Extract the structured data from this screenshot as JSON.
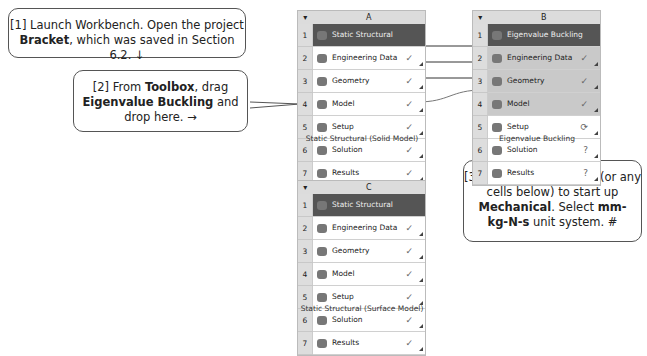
{
  "callouts": [
    {
      "id": 1,
      "parts": [
        [
          "[1] Launch Workbench.  Open the project",
          false
        ],
        [
          "\n",
          false
        ],
        [
          "Bracket",
          true
        ],
        [
          ", which was saved in Section 6.2. ↓",
          false
        ]
      ]
    },
    {
      "id": 2,
      "parts": [
        [
          "[2] From ",
          false
        ],
        [
          "Toolbox",
          true
        ],
        [
          ", drag",
          false
        ],
        [
          "\n",
          false
        ],
        [
          "Eigenvalue Buckling",
          true
        ],
        [
          " and",
          false
        ],
        [
          "\n",
          false
        ],
        [
          "drop here. →",
          false
        ]
      ]
    },
    {
      "id": 3,
      "parts": [
        [
          "[3] Double-click ",
          false
        ],
        [
          "Setup",
          true
        ],
        [
          " (or any",
          false
        ],
        [
          "\n",
          false
        ],
        [
          "cells below) to start up",
          false
        ],
        [
          "\n",
          false
        ],
        [
          "Mechanical",
          true
        ],
        [
          ".  Select ",
          false
        ],
        [
          "mm-",
          true
        ],
        [
          "\n",
          false
        ],
        [
          "kg-N-s",
          true
        ],
        [
          " unit system.  #",
          false
        ]
      ]
    }
  ],
  "systems": [
    {
      "col": "A",
      "caption": "Static Structural (Solid Model)",
      "rows": [
        {
          "n": "1",
          "label": "Static Structural",
          "status": "",
          "dark": true
        },
        {
          "n": "2",
          "label": "Engineering Data",
          "status": "✓"
        },
        {
          "n": "3",
          "label": "Geometry",
          "status": "✓"
        },
        {
          "n": "4",
          "label": "Model",
          "status": "✓"
        },
        {
          "n": "5",
          "label": "Setup",
          "status": "✓"
        },
        {
          "n": "6",
          "label": "Solution",
          "status": "✓"
        },
        {
          "n": "7",
          "label": "Results",
          "status": "✓"
        }
      ]
    },
    {
      "col": "B",
      "caption": "Eigenvalue Buckling",
      "rows": [
        {
          "n": "1",
          "label": "Eigenvalue Buckling",
          "status": "",
          "dark": true
        },
        {
          "n": "2",
          "label": "Engineering Data",
          "status": "✓",
          "grey": true
        },
        {
          "n": "3",
          "label": "Geometry",
          "status": "✓",
          "grey": true
        },
        {
          "n": "4",
          "label": "Model",
          "status": "✓",
          "grey": true
        },
        {
          "n": "5",
          "label": "Setup",
          "status": "⟳"
        },
        {
          "n": "6",
          "label": "Solution",
          "status": "?"
        },
        {
          "n": "7",
          "label": "Results",
          "status": "?"
        }
      ]
    },
    {
      "col": "C",
      "caption": "Static Structural (Surface Model)",
      "rows": [
        {
          "n": "1",
          "label": "Static Structural",
          "status": "",
          "dark": true
        },
        {
          "n": "2",
          "label": "Engineering Data",
          "status": "✓"
        },
        {
          "n": "3",
          "label": "Geometry",
          "status": "✓"
        },
        {
          "n": "4",
          "label": "Model",
          "status": "✓"
        },
        {
          "n": "5",
          "label": "Setup",
          "status": "✓"
        },
        {
          "n": "6",
          "label": "Solution",
          "status": "✓"
        },
        {
          "n": "7",
          "label": "Results",
          "status": "✓"
        }
      ]
    }
  ]
}
